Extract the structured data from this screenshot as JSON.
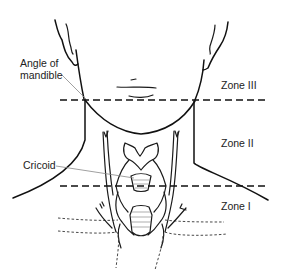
{
  "diagram": {
    "labels": {
      "angle_of_mandible": "Angle of\nmandible",
      "angle_line1": "Angle of",
      "angle_line2": "mandible",
      "cricoid": "Cricoid",
      "zone3": "Zone III",
      "zone2": "Zone II",
      "zone1": "Zone I"
    },
    "boundaries": [
      {
        "name": "angle-of-mandible-line",
        "y": 100
      },
      {
        "name": "cricoid-line",
        "y": 186
      }
    ],
    "colors": {
      "ink": "#1a1a1a",
      "leader": "#888888",
      "background": "#ffffff"
    }
  }
}
